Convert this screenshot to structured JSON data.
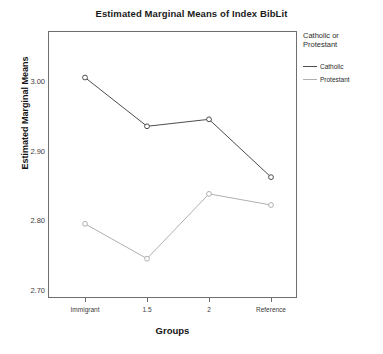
{
  "chart_data": {
    "type": "line",
    "title": "Estimated Marginal Means of Index BibLit",
    "xlabel": "Groups",
    "ylabel": "Estimated Marginal Means",
    "categories": [
      "Immigrant",
      "1.5",
      "2",
      "Reference"
    ],
    "ylim": [
      2.66,
      3.03
    ],
    "yticks": [
      "2.70",
      "2.80",
      "2.90",
      "3.00"
    ],
    "ytick_values": [
      2.7,
      2.8,
      2.9,
      3.0
    ],
    "grid": false,
    "legend_position": "right",
    "legend_title": "Catholic or Protestant",
    "markers": "open-circle",
    "series": [
      {
        "name": "Catholic",
        "color": "#4d4d4d",
        "values": [
          3.005,
          2.935,
          2.945,
          2.862
        ]
      },
      {
        "name": "Protestant",
        "color": "#b0b0b0",
        "values": [
          2.795,
          2.745,
          2.838,
          2.822
        ]
      }
    ]
  },
  "legend": {
    "title_line1": "Catholic or",
    "title_line2": "Protestant",
    "items": [
      {
        "label": "Catholic",
        "color": "#4d4d4d"
      },
      {
        "label": "Protestant",
        "color": "#b0b0b0"
      }
    ]
  },
  "clipped_header": "",
  "axis": {
    "y_title": "Estimated Marginal Means",
    "x_title": "Groups",
    "y_tick_labels": [
      "3.00",
      "2.90",
      "2.80",
      "2.70"
    ],
    "x_tick_labels": [
      "Immigrant",
      "1.5",
      "2",
      "Reference"
    ]
  },
  "title": "Estimated Marginal Means of Index BibLit"
}
